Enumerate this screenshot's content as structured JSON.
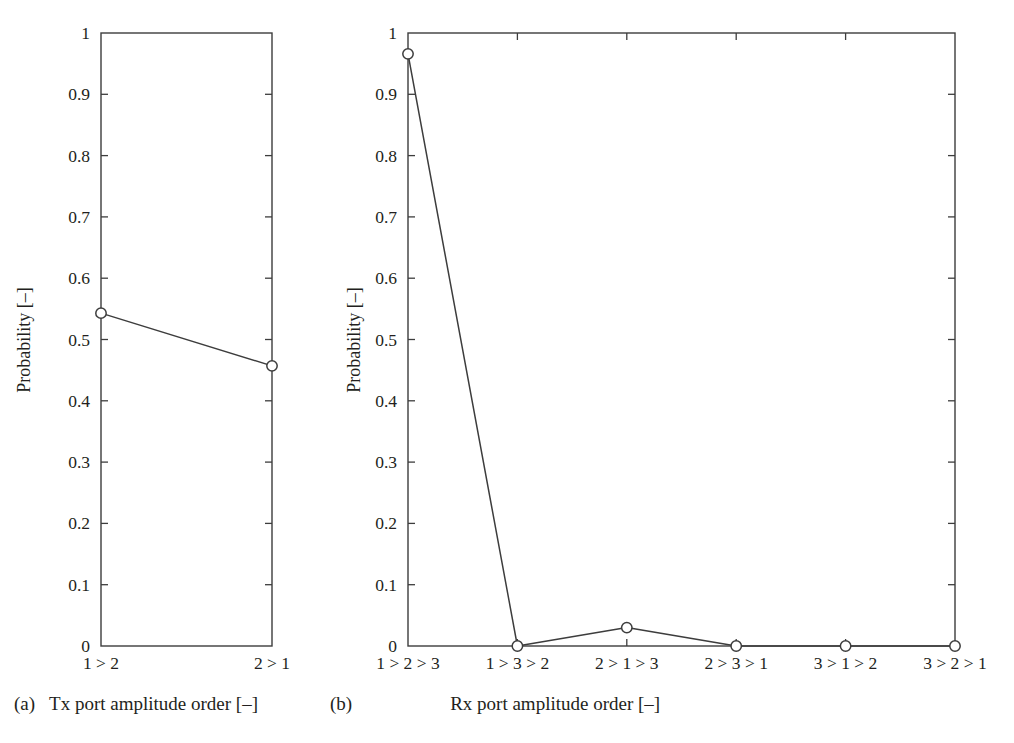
{
  "figure": {
    "background": "#ffffff",
    "line_color": "#3d3d3d",
    "marker_color": "#3d3d3d",
    "axis_color": "#3d3d3d",
    "text_color": "#231f20"
  },
  "subfigures": [
    {
      "tag": "(a)",
      "caption": "Tx port amplitude order [–]"
    },
    {
      "tag": "(b)",
      "caption": "Rx port amplitude order [–]"
    }
  ],
  "chart_data": [
    {
      "type": "line",
      "panel": "a",
      "title": "",
      "subtitle": "",
      "xlabel": "Tx port amplitude order [–]",
      "ylabel": "Probability [–]",
      "categories": [
        "1 > 2",
        "2 > 1"
      ],
      "values": [
        0.543,
        0.457
      ],
      "series": [
        {
          "name": "Tx port amplitude order probability",
          "values": [
            0.543,
            0.457
          ]
        }
      ],
      "ylim": [
        0,
        1
      ],
      "yticks": [
        0,
        0.1,
        0.2,
        0.3,
        0.4,
        0.5,
        0.6,
        0.7,
        0.8,
        0.9,
        1
      ],
      "ytick_labels": [
        "0",
        "0.1",
        "0.2",
        "0.3",
        "0.4",
        "0.5",
        "0.6",
        "0.7",
        "0.8",
        "0.9",
        "1"
      ],
      "grid": false,
      "legend": false,
      "legend_position": "none",
      "marker": "circle-open",
      "ticks_direction": "in",
      "box_frame": true
    },
    {
      "type": "line",
      "panel": "b",
      "title": "",
      "subtitle": "",
      "xlabel": "Rx port amplitude order [–]",
      "ylabel": "Probability [–]",
      "categories": [
        "1 > 2 > 3",
        "1 > 3 > 2",
        "2 > 1 > 3",
        "2 > 3 > 1",
        "3 > 1 > 2",
        "3 > 2 > 1"
      ],
      "values": [
        0.966,
        0.0,
        0.03,
        0.0,
        0.0,
        0.0
      ],
      "series": [
        {
          "name": "Rx port amplitude order probability",
          "values": [
            0.966,
            0.0,
            0.03,
            0.0,
            0.0,
            0.0
          ]
        }
      ],
      "ylim": [
        0,
        1
      ],
      "yticks": [
        0,
        0.1,
        0.2,
        0.3,
        0.4,
        0.5,
        0.6,
        0.7,
        0.8,
        0.9,
        1
      ],
      "ytick_labels": [
        "0",
        "0.1",
        "0.2",
        "0.3",
        "0.4",
        "0.5",
        "0.6",
        "0.7",
        "0.8",
        "0.9",
        "1"
      ],
      "grid": false,
      "legend": false,
      "legend_position": "none",
      "marker": "circle-open",
      "ticks_direction": "in",
      "box_frame": true
    }
  ]
}
